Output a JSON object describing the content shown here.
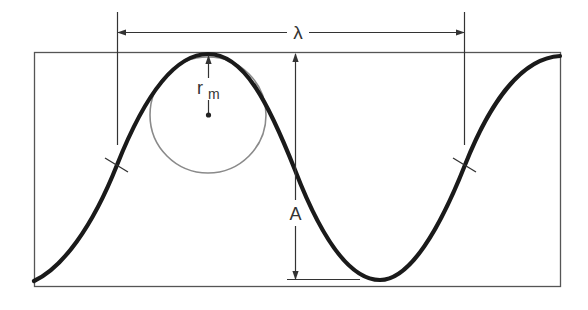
{
  "diagram": {
    "labels": {
      "wavelength": "λ",
      "amplitude": "A",
      "radius_main": "r",
      "radius_sub": "m"
    },
    "colors": {
      "curve": "#1a1a1a",
      "frame": "#555555",
      "dimension_lines": "#333333",
      "circle": "#8a8a8a",
      "background": "#ffffff"
    },
    "elements": [
      {
        "name": "frame",
        "type": "rectangle"
      },
      {
        "name": "wave-curve",
        "type": "sinusoid"
      },
      {
        "name": "wavelength-dimension",
        "type": "double-arrow",
        "label": "λ"
      },
      {
        "name": "amplitude-dimension",
        "type": "double-arrow",
        "label": "A"
      },
      {
        "name": "radius-of-curvature-circle",
        "type": "circle",
        "label": "r_m"
      },
      {
        "name": "inflection-tick-left",
        "type": "tick"
      },
      {
        "name": "inflection-tick-right",
        "type": "tick"
      }
    ]
  }
}
